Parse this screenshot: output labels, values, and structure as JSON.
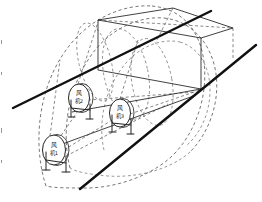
{
  "figure": {
    "background_color": "#ffffff",
    "line_color": "#111111",
    "dash_color": "#4b4b4b"
  },
  "fans": [
    {
      "id": "fan-1",
      "label_line1": "风",
      "label_line2": "机1",
      "label_full": "风机1",
      "index": "1",
      "cx": 54,
      "cy": 150,
      "rx": 12,
      "ry": 15
    },
    {
      "id": "fan-2",
      "label_line1": "风",
      "label_line2": "机2",
      "label_full": "风机2",
      "index": "2",
      "cx": 79,
      "cy": 98,
      "rx": 11,
      "ry": 14
    },
    {
      "id": "fan-3",
      "label_line1": "风",
      "label_line2": "机3",
      "label_full": "风机3",
      "index": "3",
      "cx": 120,
      "cy": 113,
      "rx": 11,
      "ry": 14
    }
  ],
  "boundary_lines": [
    {
      "id": "upper-boundary",
      "from": [
        13,
        108
      ],
      "to": [
        211,
        11
      ],
      "style": "solid-thick"
    },
    {
      "id": "lower-boundary",
      "from": [
        80,
        189
      ],
      "to": [
        256,
        45
      ],
      "style": "solid-thick"
    }
  ],
  "box": {
    "id": "room-volume",
    "top_face": [
      [
        98,
        20
      ],
      [
        173,
        8
      ],
      [
        233,
        28
      ],
      [
        156,
        42
      ]
    ],
    "left_vertical": [
      [
        98,
        20
      ],
      [
        98,
        70
      ]
    ],
    "right_vertical": [
      [
        201,
        38
      ],
      [
        201,
        89
      ]
    ],
    "bottom_front": [
      [
        98,
        70
      ],
      [
        201,
        89
      ]
    ],
    "visible_edges": 9
  },
  "airflow": {
    "type": "dashed-elliptical-envelopes",
    "count": 3,
    "description": "Each fan emits a dashed elliptical jet envelope expanding toward the far boundary."
  },
  "legend": {
    "solid_label": "实线：边界",
    "dashed_label": "虚线：气流",
    "visible": false
  }
}
